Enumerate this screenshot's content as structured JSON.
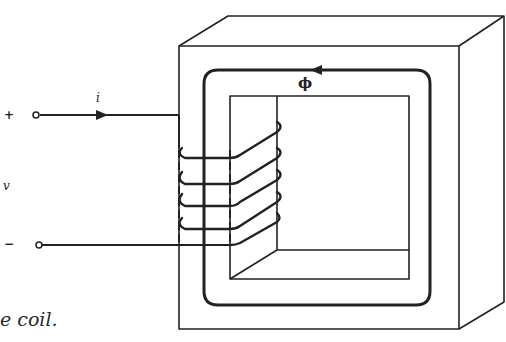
{
  "diagram": {
    "type": "magnetic core with coil (transformer/inductor)",
    "labels": {
      "plus_terminal": "+",
      "minus_terminal": "−",
      "current": "i",
      "voltage": "v",
      "flux": "ϕ"
    },
    "caption_fragment": "e coil."
  },
  "colors": {
    "ink": "#222222",
    "background": "#ffffff"
  }
}
